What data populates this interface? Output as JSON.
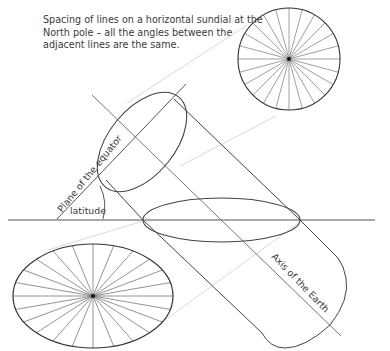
{
  "caption": "Spacing of lines on a horizontal sundial at the North pole – all the angles between the adjacent lines are the same.",
  "labels": {
    "equator_plane": "Plane of the equator",
    "latitude": "latitude",
    "earth_axis": "Axis of the Earth"
  },
  "figure": {
    "sundial_circle": {
      "cx": 289,
      "cy": 59,
      "r": 51,
      "spokes": 24
    },
    "projected_ellipse": {
      "cx": 93,
      "cy": 296,
      "rx": 80,
      "ry": 52,
      "spokes": 24
    },
    "horizontal_plane_ellipse": {
      "cx": 221.5,
      "cy": 220,
      "rx": 78.5,
      "ry": 22
    },
    "colors": {
      "line": "#444444",
      "spoke": "#7a7a7a",
      "projection": "#d8d8d8"
    }
  }
}
